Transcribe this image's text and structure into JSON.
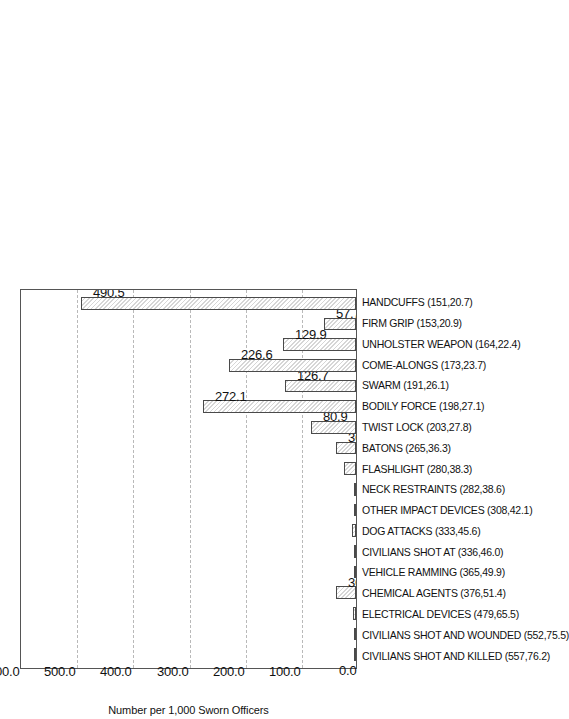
{
  "chart_data": {
    "type": "bar",
    "title": "",
    "subtitle": "",
    "xlabel": "",
    "ylabel": "Number per 1,000 Sworn Officers",
    "ylim": [
      0.0,
      600.0
    ],
    "yticks": [
      "0.0",
      "100.0",
      "200.0",
      "300.0",
      "400.0",
      "500.0",
      "600.0"
    ],
    "ytick_values": [
      0,
      100,
      200,
      300,
      400,
      500,
      600
    ],
    "grid": true,
    "gridlines": [
      100,
      200,
      300,
      400,
      500
    ],
    "legend": null,
    "orientation": "rotated-90",
    "categories": [
      "CIVILIANS SHOT AND KILLED (557,76.2)",
      "CIVILIANS SHOT AND WOUNDED (552,75.5)",
      "ELECTRICAL DEVICES (479,65.5)",
      "CHEMICAL AGENTS (376,51.4)",
      "VEHICLE RAMMING (365,49.9)",
      "CIVILIANS SHOT AT (336,46.0)",
      "DOG ATTACKS (333,45.6)",
      "OTHER IMPACT DEVICES (308,42.1)",
      "NECK RESTRAINTS (282,38.6)",
      "FLASHLIGHT (280,38.3)",
      "BATONS (265,36.3)",
      "TWIST LOCK  (203,27.8)",
      "BODILY FORCE (198,27.1)",
      "SWARM (191,26.1)",
      "COME-ALONGS (173,23.7)",
      "UNHOLSTER WEAPON (164,22.4)",
      "FIRM GRIP (153,20.9)",
      "HANDCUFFS (151,20.7)"
    ],
    "values": [
      0.9,
      0.2,
      5.4,
      36.2,
      1.0,
      3.0,
      6.5,
      2.4,
      1.4,
      21.7,
      36.0,
      80.9,
      272.1,
      126.7,
      226.6,
      129.9,
      57.7,
      490.5
    ],
    "value_labels": [
      "0.9",
      "0.2",
      "5.4",
      "36.2",
      "1.0",
      "3.0",
      "6.5",
      "2.4",
      "1.4",
      "21.7",
      "36.0",
      "80.9",
      "272.1",
      "126.7",
      "226.6",
      "129.9",
      "57.7",
      "490.5"
    ]
  },
  "style": {
    "bar_fill": "#d6d6d6",
    "bar_edge": "#4a4a4a",
    "grid_color": "#b9b9b9",
    "frame_color": "#555555",
    "text_color": "#111111",
    "background": "#ffffff"
  }
}
